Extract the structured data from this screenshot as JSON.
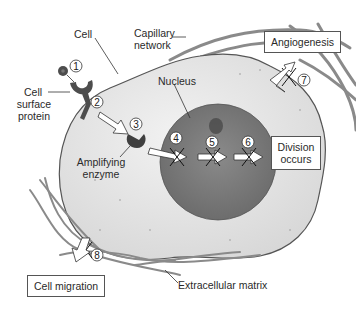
{
  "diagram": {
    "labels": {
      "cell": "Cell",
      "capillary_line1": "Capillary",
      "capillary_line2": "network",
      "surface_line1": "Cell",
      "surface_line2": "surface",
      "surface_line3": "protein",
      "nucleus": "Nucleus",
      "enzyme_line1": "Amplifying",
      "enzyme_line2": "enzyme",
      "ecm": "Extracellular matrix"
    },
    "boxes": {
      "angiogenesis": "Angiogenesis",
      "division_line1": "Division",
      "division_line2": "occurs",
      "migration": "Cell migration"
    },
    "steps": [
      "1",
      "2",
      "3",
      "4",
      "5",
      "6",
      "7",
      "8"
    ],
    "colors": {
      "cell_fill": "#e4e4e4",
      "cell_outline": "#555555",
      "nucleus_fill": "#7a7a7a",
      "nucleolus": "#4a4a4a",
      "protein": "#4d4d4d",
      "vessel": "#8a8a8a",
      "arrow_fill": "#ffffff"
    }
  }
}
